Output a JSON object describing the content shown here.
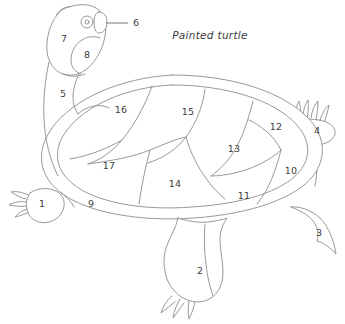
{
  "figure": {
    "title": "Painted turtle",
    "title_x": 210,
    "title_y": 35,
    "background_color": "#ffffff",
    "line_color": "#8d8d8d",
    "label_color": "#3d3d3d",
    "width": 345,
    "height": 324
  },
  "labels": [
    {
      "id": "1",
      "text": "1",
      "x": 42,
      "y": 204,
      "part": "front-left-limb"
    },
    {
      "id": "2",
      "text": "2",
      "x": 200,
      "y": 271,
      "part": "hind-limb"
    },
    {
      "id": "3",
      "text": "3",
      "x": 319,
      "y": 233,
      "part": "tail"
    },
    {
      "id": "4",
      "text": "4",
      "x": 317,
      "y": 131,
      "part": "hind-right-foot"
    },
    {
      "id": "5",
      "text": "5",
      "x": 63,
      "y": 94,
      "part": "neck"
    },
    {
      "id": "6",
      "text": "6",
      "x": 136,
      "y": 23,
      "part": "nostril"
    },
    {
      "id": "7",
      "text": "7",
      "x": 64,
      "y": 39,
      "part": "head-dorsal"
    },
    {
      "id": "8",
      "text": "8",
      "x": 87,
      "y": 55,
      "part": "jaw-cheek"
    },
    {
      "id": "9",
      "text": "9",
      "x": 91,
      "y": 204,
      "part": "marginal-scute"
    },
    {
      "id": "10",
      "text": "10",
      "x": 291,
      "y": 171,
      "part": "costal-scute-right"
    },
    {
      "id": "11",
      "text": "11",
      "x": 244,
      "y": 196,
      "part": "costal-scute"
    },
    {
      "id": "12",
      "text": "12",
      "x": 276,
      "y": 127,
      "part": "vertebral-scute-rear"
    },
    {
      "id": "13",
      "text": "13",
      "x": 234,
      "y": 149,
      "part": "vertebral-scute"
    },
    {
      "id": "14",
      "text": "14",
      "x": 175,
      "y": 184,
      "part": "costal-scute-lower"
    },
    {
      "id": "15",
      "text": "15",
      "x": 188,
      "y": 112,
      "part": "vertebral-scute-mid"
    },
    {
      "id": "16",
      "text": "16",
      "x": 121,
      "y": 110,
      "part": "costal-scute-upper-left"
    },
    {
      "id": "17",
      "text": "17",
      "x": 109,
      "y": 166,
      "part": "costal-scute-left"
    }
  ],
  "leader": {
    "name": "nostril-leader-line",
    "x1": 106,
    "y1": 23,
    "x2": 128,
    "y2": 23
  }
}
